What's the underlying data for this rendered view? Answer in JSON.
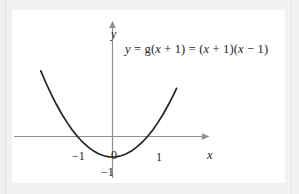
{
  "figure": {
    "kind": "cartesian-graph",
    "background_color": "#f1f1f1",
    "card_color": "#ffffff",
    "curve_color": "#222222",
    "axis_color": "#8f8f8f",
    "text_color": "#1c1c1c",
    "equation": {
      "full_text": "y = g(x + 1) = (x + 1)(x − 1)",
      "lhs": "y",
      "eq1": "=",
      "middle": "g(x + 1)",
      "eq2": "=",
      "rhs": "(x + 1)(x − 1)",
      "parts": {
        "y": "y",
        "equals": "=",
        "g": "g",
        "open": "(",
        "x": "x",
        "plus": "+",
        "one": "1",
        "close": ")",
        "minus": "−"
      }
    },
    "axes": {
      "x_label": "x",
      "y_label": "y",
      "x_tick_labels": [
        "−1",
        "0",
        "1"
      ],
      "y_tick_labels": [
        "−1"
      ]
    }
  },
  "chart_data": {
    "type": "line",
    "title": "",
    "subtitle": "",
    "xlabel": "x",
    "ylabel": "y",
    "annotations": [
      "y = g(x + 1) = (x + 1)(x − 1)"
    ],
    "legend": [],
    "legend_position": "none",
    "grid": false,
    "xlim": [
      -2.2,
      2.0
    ],
    "ylim": [
      -1.45,
      3.2
    ],
    "xticks": [
      -1,
      0,
      1
    ],
    "xticklabels": [
      "−1",
      "0",
      "1"
    ],
    "yticks": [
      -1
    ],
    "yticklabels": [
      "−1"
    ],
    "series": [
      {
        "name": "y = (x + 1)(x − 1)",
        "equation": "y = x^2 - 1",
        "roots": [
          -1,
          1
        ],
        "vertex": [
          0,
          -1
        ],
        "y_intercept": -1,
        "x": [
          -2.05,
          -1.9,
          -1.75,
          -1.6,
          -1.45,
          -1.3,
          -1.15,
          -1.0,
          -0.85,
          -0.7,
          -0.55,
          -0.4,
          -0.25,
          -0.1,
          0.0,
          0.1,
          0.25,
          0.4,
          0.55,
          0.7,
          0.85,
          1.0,
          1.15,
          1.3,
          1.45,
          1.6,
          1.75,
          1.83
        ],
        "values": [
          3.2,
          2.61,
          2.06,
          1.56,
          1.1,
          0.69,
          0.32,
          0.0,
          -0.28,
          -0.51,
          -0.7,
          -0.84,
          -0.94,
          -0.99,
          -1.0,
          -0.99,
          -0.94,
          -0.84,
          -0.7,
          -0.51,
          -0.28,
          0.0,
          0.32,
          0.69,
          1.1,
          1.56,
          2.06,
          2.35
        ]
      }
    ]
  }
}
